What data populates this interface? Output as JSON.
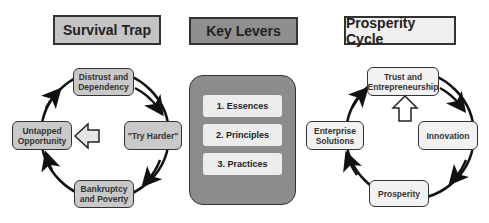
{
  "panels": {
    "survival_trap": {
      "title": "Survival Trap",
      "nodes": {
        "top": "Distrust and\nDependency",
        "right": "\"Try Harder\"",
        "bottom": "Bankruptcy\nand Poverty",
        "left": "Untapped\nOpportunity"
      }
    },
    "key_levers": {
      "title": "Key Levers",
      "items": [
        "1. Essences",
        "2. Principles",
        "3. Practices"
      ]
    },
    "prosperity_cycle": {
      "title": "Prosperity Cycle",
      "nodes": {
        "top": "Trust and\nEntrepreneurship",
        "right": "Innovation",
        "bottom": "Prosperity",
        "left": "Enterprise\nSolutions"
      }
    }
  },
  "colors": {
    "survival_header_bg": "#c4c4c4",
    "levers_header_bg": "#8f8f8f",
    "prosperity_header_bg": "#f0f0f0",
    "levers_box_bg": "#8c8c8c",
    "lever_item_bg": "#ececec",
    "outline": "#333333"
  }
}
